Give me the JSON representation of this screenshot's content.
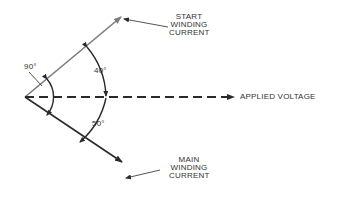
{
  "diagram": {
    "vectors": {
      "start_winding": {
        "label_lines": [
          "START",
          "WINDING",
          "CURRENT"
        ],
        "color": "#7a7a7a"
      },
      "main_winding": {
        "label_lines": [
          "MAIN",
          "WINDING",
          "CURRENT"
        ],
        "color": "#2a2a2a"
      },
      "applied_voltage": {
        "label": "APPLIED VOLTAGE",
        "style": "dashed",
        "color": "#2a2a2a"
      }
    },
    "angles": {
      "between_currents": "90°",
      "start_to_voltage": "40°",
      "voltage_to_main": "50°"
    }
  }
}
